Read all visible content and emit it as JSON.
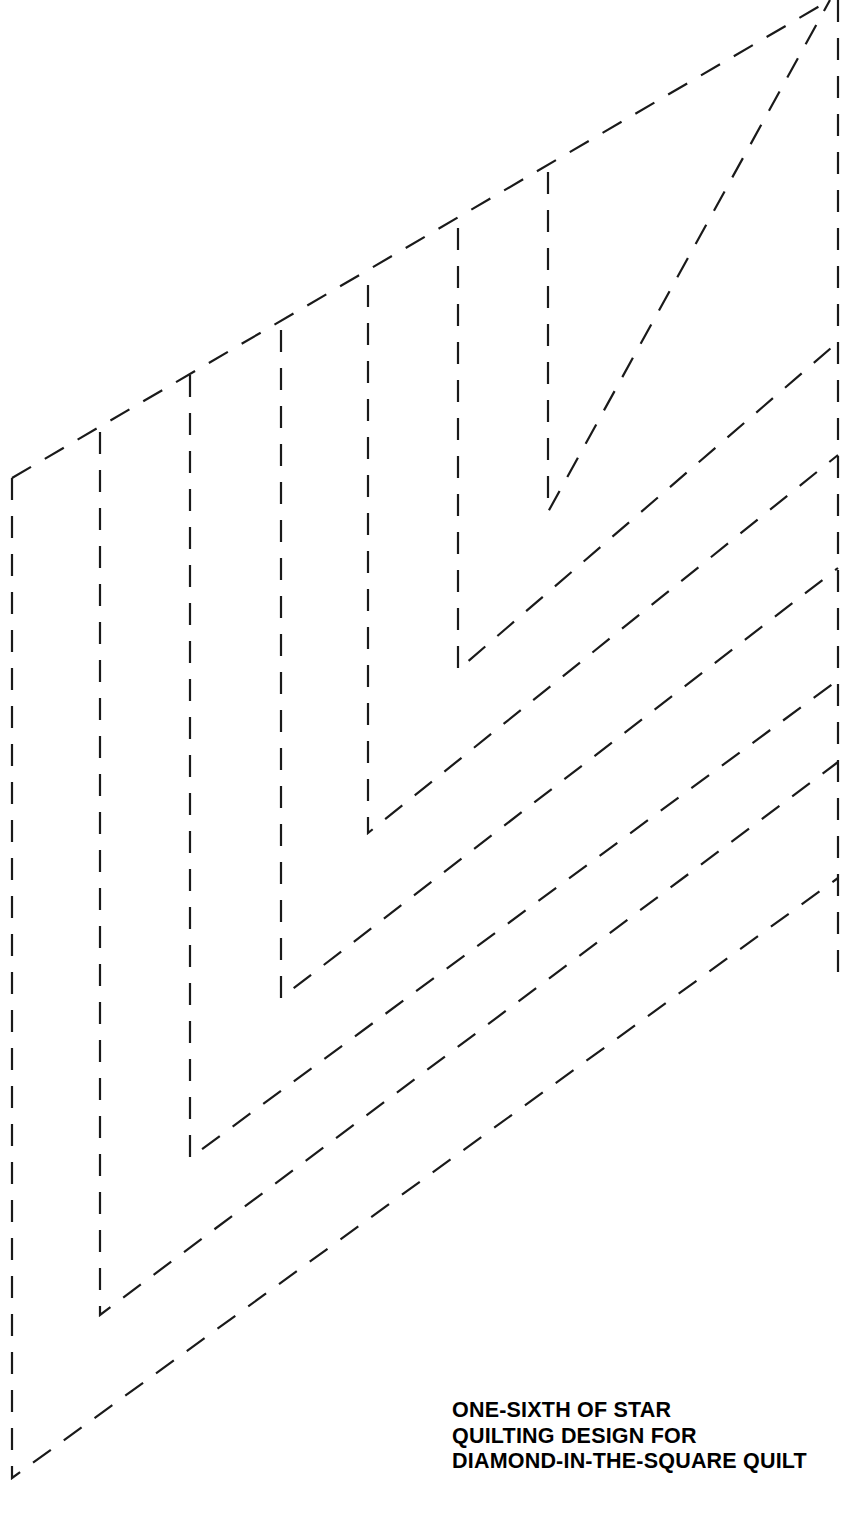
{
  "document": {
    "title": "One-Sixth of Star Quilting Design",
    "kind": "quilting-pattern-template",
    "canvas": {
      "width": 855,
      "height": 1531
    },
    "background_color": "#ffffff",
    "line_color": "#1a1a1a"
  },
  "caption": {
    "lines": [
      "ONE-SIXTH OF STAR",
      "QUILTING DESIGN FOR",
      "DIAMOND-IN-THE-SQUARE QUILT"
    ],
    "line1": "ONE-SIXTH OF STAR",
    "line2": "QUILTING DESIGN FOR",
    "line3": "DIAMOND-IN-THE-SQUARE QUILT",
    "position": {
      "x": 452,
      "y": 1398
    },
    "color": "#000000",
    "weight": "bold"
  },
  "chart_data": {
    "type": "line",
    "title": "One-sixth of star quilting design for diamond-in-the-square quilt",
    "xlabel": "",
    "ylabel": "",
    "grid": false,
    "legend": "none",
    "xlim": [
      0,
      855
    ],
    "ylim": [
      1531,
      0
    ],
    "style": {
      "stroke": "#1a1a1a",
      "stroke_width": 2.2,
      "dash_pattern": "22 16",
      "fill": "none",
      "linecap": "butt"
    },
    "shared_right_edge": {
      "name": "right-vertical-edge",
      "x": 838,
      "y_top": 0,
      "y_bottom": 988
    },
    "diagonal_slope": -0.576,
    "series": [
      {
        "name": "chevron-1-innermost",
        "vertical_x": 548,
        "vertical_y_top": 172,
        "corner_y": 512,
        "diagonal_end_x": 830,
        "diagonal_end_y": 0,
        "points": [
          [
            548,
            172
          ],
          [
            548,
            512
          ],
          [
            830,
            0
          ]
        ]
      },
      {
        "name": "chevron-2",
        "vertical_x": 458,
        "vertical_y_top": 228,
        "corner_y": 670,
        "diagonal_end_x": 838,
        "diagonal_end_y": 342,
        "points": [
          [
            458,
            228
          ],
          [
            458,
            670
          ],
          [
            838,
            342
          ]
        ]
      },
      {
        "name": "chevron-3",
        "vertical_x": 368,
        "vertical_y_top": 285,
        "corner_y": 833,
        "diagonal_end_x": 838,
        "diagonal_end_y": 455,
        "points": [
          [
            368,
            285
          ],
          [
            368,
            833
          ],
          [
            838,
            455
          ]
        ]
      },
      {
        "name": "chevron-4",
        "vertical_x": 281,
        "vertical_y_top": 330,
        "corner_y": 998,
        "diagonal_end_x": 838,
        "diagonal_end_y": 568,
        "points": [
          [
            281,
            330
          ],
          [
            281,
            998
          ],
          [
            838,
            568
          ]
        ]
      },
      {
        "name": "chevron-5",
        "vertical_x": 190,
        "vertical_y_top": 375,
        "corner_y": 1158,
        "diagonal_end_x": 838,
        "diagonal_end_y": 680,
        "points": [
          [
            190,
            375
          ],
          [
            190,
            1158
          ],
          [
            838,
            680
          ]
        ]
      },
      {
        "name": "chevron-6",
        "vertical_x": 100,
        "vertical_y_top": 432,
        "corner_y": 1315,
        "diagonal_end_x": 838,
        "diagonal_end_y": 762,
        "points": [
          [
            100,
            432
          ],
          [
            100,
            1315
          ],
          [
            838,
            762
          ]
        ]
      },
      {
        "name": "chevron-7-outermost",
        "vertical_x": 12,
        "vertical_y_top": 478,
        "corner_y": 1478,
        "diagonal_end_x": 838,
        "diagonal_end_y": 878,
        "points": [
          [
            12,
            478
          ],
          [
            12,
            1478
          ],
          [
            838,
            878
          ]
        ]
      }
    ],
    "top_diagonal": {
      "name": "upper-outer-diagonal",
      "points": [
        [
          12,
          478
        ],
        [
          830,
          0
        ]
      ],
      "note": "Long uppermost diagonal running from the top of the outermost vertical up to the top right corner, crossing the tops of all inner verticals."
    }
  }
}
